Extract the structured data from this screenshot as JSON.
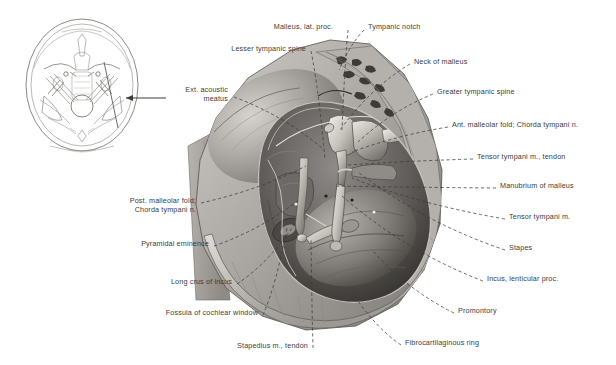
{
  "figure": {
    "background_color": "#ffffff",
    "label_color": "#3c3c3c",
    "leader_line_style": "dashed",
    "inset": {
      "name": "skull-base-inset",
      "description": "Axial section of skull base, superior view, with arrow indicating right petrous temporal bone",
      "arrow_direction": "left"
    }
  },
  "labels": [
    {
      "id": "malleus-lat-proc",
      "text": "Malleus, lat. proc.",
      "align": "right",
      "x": 333,
      "y": 22,
      "anchor_x": 348,
      "anchor_y": 30,
      "target_x": 342,
      "target_y": 130
    },
    {
      "id": "tympanic-notch",
      "text": "Tympanic notch",
      "align": "left",
      "x": 368,
      "y": 22,
      "anchor_x": 364,
      "anchor_y": 30,
      "target_x": 339,
      "target_y": 70
    },
    {
      "id": "lesser-tympanic-spine",
      "text": "Lesser tympanic spine",
      "align": "right",
      "x": 306,
      "y": 44,
      "anchor_x": 311,
      "anchor_y": 51,
      "target_x": 325,
      "target_y": 160
    },
    {
      "id": "neck-of-malleus",
      "text": "Neck of malleus",
      "align": "left",
      "x": 414,
      "y": 57,
      "anchor_x": 410,
      "anchor_y": 64,
      "target_x": 340,
      "target_y": 130
    },
    {
      "id": "ext-acoustic-meatus",
      "text": "Ext. acoustic\nmeatus",
      "align": "right",
      "x": 228,
      "y": 85,
      "anchor_x": 234,
      "anchor_y": 97,
      "target_x": 322,
      "target_y": 148
    },
    {
      "id": "greater-tympanic-spine",
      "text": "Greater tympanic spine",
      "align": "left",
      "x": 437,
      "y": 87,
      "anchor_x": 433,
      "anchor_y": 94,
      "target_x": 358,
      "target_y": 142
    },
    {
      "id": "ant-malleolar-fold",
      "text": "Ant. malleolar fold; Chorda tympani n.",
      "align": "left",
      "x": 452,
      "y": 120,
      "anchor_x": 448,
      "anchor_y": 127,
      "target_x": 352,
      "target_y": 152
    },
    {
      "id": "tensor-tympani-tendon",
      "text": "Tensor tympani m., tendon",
      "align": "left",
      "x": 477,
      "y": 152,
      "anchor_x": 473,
      "anchor_y": 159,
      "target_x": 348,
      "target_y": 165
    },
    {
      "id": "manubrium-of-malleus",
      "text": "Manubrium of malleus",
      "align": "left",
      "x": 500,
      "y": 181,
      "anchor_x": 496,
      "anchor_y": 188,
      "target_x": 335,
      "target_y": 186
    },
    {
      "id": "tensor-tympani-m",
      "text": "Tensor tympani m.",
      "align": "left",
      "x": 509,
      "y": 212,
      "anchor_x": 505,
      "anchor_y": 219,
      "target_x": 352,
      "target_y": 178
    },
    {
      "id": "stapes",
      "text": "Stapes",
      "align": "left",
      "x": 509,
      "y": 243,
      "anchor_x": 505,
      "anchor_y": 250,
      "target_x": 358,
      "target_y": 172
    },
    {
      "id": "incus-lenticular-proc",
      "text": "Incus, lenticular proc.",
      "align": "left",
      "x": 487,
      "y": 274,
      "anchor_x": 483,
      "anchor_y": 281,
      "target_x": 342,
      "target_y": 196
    },
    {
      "id": "promontory",
      "text": "Promontory",
      "align": "left",
      "x": 458,
      "y": 306,
      "anchor_x": 454,
      "anchor_y": 313,
      "target_x": 372,
      "target_y": 250
    },
    {
      "id": "fibrocartilaginous-ring",
      "text": "Fibrocartilaginous ring",
      "align": "left",
      "x": 405,
      "y": 338,
      "anchor_x": 401,
      "anchor_y": 345,
      "target_x": 352,
      "target_y": 292
    },
    {
      "id": "post-malleolar-fold",
      "text": "Post. malleolar fold;\nChorda tympani n.",
      "align": "right",
      "x": 196,
      "y": 196,
      "anchor_x": 201,
      "anchor_y": 203,
      "target_x": 306,
      "target_y": 166
    },
    {
      "id": "pyramidal-eminence",
      "text": "Pyramidal eminence",
      "align": "right",
      "x": 209,
      "y": 239,
      "anchor_x": 214,
      "anchor_y": 246,
      "target_x": 300,
      "target_y": 199
    },
    {
      "id": "long-crus-of-incus",
      "text": "Long crus of incus",
      "align": "right",
      "x": 232,
      "y": 277,
      "anchor_x": 237,
      "anchor_y": 284,
      "target_x": 296,
      "target_y": 222
    },
    {
      "id": "fossula-cochlear-window",
      "text": "Fossula of cochlear window",
      "align": "right",
      "x": 258,
      "y": 308,
      "anchor_x": 263,
      "anchor_y": 315,
      "target_x": 287,
      "target_y": 228
    },
    {
      "id": "stapedius-m-tendon",
      "text": "Stapedius m., tendon",
      "align": "right",
      "x": 308,
      "y": 341,
      "anchor_x": 313,
      "anchor_y": 348,
      "target_x": 311,
      "target_y": 238
    }
  ]
}
